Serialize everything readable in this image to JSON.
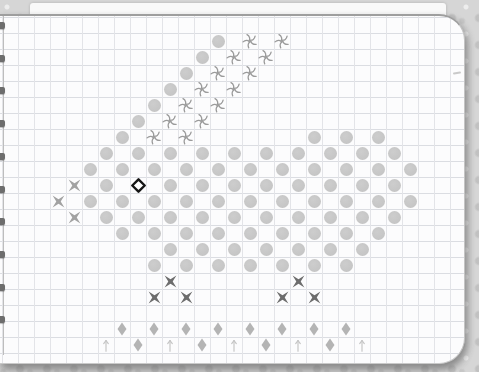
{
  "page": {
    "kind": "spiral-notebook-graph-paper",
    "paper_color": "#fcfcfd",
    "grid_line_color_v": "#e3e4e8",
    "grid_line_color_h": "#dbdde2",
    "background_color": "#d6d6d6",
    "binding": {
      "stub_count": 10,
      "stub_color": "#6d6d6d"
    }
  },
  "pattern": {
    "type": "stitch-chart-grid",
    "grid": {
      "cell": 16,
      "origin_x": 138,
      "origin_y": 169
    },
    "legend": {
      "O": "stitch-dot",
      "S": "stitch-swirl",
      "X": "stitch-cross-light",
      "XL": "stitch-cross-dark",
      "D": "stitch-diamond",
      "A": "stitch-arrow-up",
      "E": "stitch-eye"
    },
    "colors": {
      "dot": "#c6c6c6",
      "swirl": "#9b9b9b",
      "cross_light": "#a2a2a2",
      "cross_dark": "#6d6d6d",
      "diamond": "#b4b4b4",
      "arrow": "#c6c6c6",
      "eye_stroke": "#161616",
      "eye_fill": "#ffffff"
    },
    "rows": [
      {
        "r": -9,
        "items": [
          [
            "O",
            5
          ],
          [
            "S",
            7
          ],
          [
            "S",
            9
          ]
        ]
      },
      {
        "r": -8,
        "items": [
          [
            "O",
            4
          ],
          [
            "S",
            6
          ],
          [
            "S",
            8
          ]
        ]
      },
      {
        "r": -7,
        "items": [
          [
            "O",
            3
          ],
          [
            "S",
            5
          ],
          [
            "S",
            7
          ]
        ]
      },
      {
        "r": -6,
        "items": [
          [
            "O",
            2
          ],
          [
            "S",
            4
          ],
          [
            "S",
            6
          ]
        ]
      },
      {
        "r": -5,
        "items": [
          [
            "O",
            1
          ],
          [
            "S",
            3
          ],
          [
            "S",
            5
          ]
        ]
      },
      {
        "r": -4,
        "items": [
          [
            "O",
            0
          ],
          [
            "S",
            2
          ],
          [
            "S",
            4
          ]
        ]
      },
      {
        "r": -3,
        "items": [
          [
            "O",
            -1
          ],
          [
            "S",
            1
          ],
          [
            "S",
            3
          ],
          [
            "O",
            11
          ],
          [
            "O",
            13
          ],
          [
            "O",
            15
          ]
        ]
      },
      {
        "r": -2,
        "items": [
          [
            "O",
            -2
          ],
          [
            "O",
            0
          ],
          [
            "O",
            2
          ],
          [
            "O",
            4
          ],
          [
            "O",
            6
          ],
          [
            "O",
            8
          ],
          [
            "O",
            10
          ],
          [
            "O",
            12
          ],
          [
            "O",
            14
          ],
          [
            "O",
            16
          ]
        ]
      },
      {
        "r": -1,
        "items": [
          [
            "O",
            -3
          ],
          [
            "O",
            -1
          ],
          [
            "O",
            1
          ],
          [
            "O",
            3
          ],
          [
            "O",
            5
          ],
          [
            "O",
            7
          ],
          [
            "O",
            9
          ],
          [
            "O",
            11
          ],
          [
            "O",
            13
          ],
          [
            "O",
            15
          ],
          [
            "O",
            17
          ]
        ]
      },
      {
        "r": 0,
        "items": [
          [
            "X",
            -4
          ],
          [
            "O",
            -2
          ],
          [
            "E",
            0
          ],
          [
            "O",
            2
          ],
          [
            "O",
            4
          ],
          [
            "O",
            6
          ],
          [
            "O",
            8
          ],
          [
            "O",
            10
          ],
          [
            "O",
            12
          ],
          [
            "O",
            14
          ],
          [
            "O",
            16
          ]
        ]
      },
      {
        "r": 1,
        "items": [
          [
            "X",
            -5
          ],
          [
            "O",
            -3
          ],
          [
            "O",
            -1
          ],
          [
            "O",
            1
          ],
          [
            "O",
            3
          ],
          [
            "O",
            5
          ],
          [
            "O",
            7
          ],
          [
            "O",
            9
          ],
          [
            "O",
            11
          ],
          [
            "O",
            13
          ],
          [
            "O",
            15
          ],
          [
            "O",
            17
          ]
        ]
      },
      {
        "r": 2,
        "items": [
          [
            "X",
            -4
          ],
          [
            "O",
            -2
          ],
          [
            "O",
            0
          ],
          [
            "O",
            2
          ],
          [
            "O",
            4
          ],
          [
            "O",
            6
          ],
          [
            "O",
            8
          ],
          [
            "O",
            10
          ],
          [
            "O",
            12
          ],
          [
            "O",
            14
          ],
          [
            "O",
            16
          ]
        ]
      },
      {
        "r": 3,
        "items": [
          [
            "O",
            -1
          ],
          [
            "O",
            1
          ],
          [
            "O",
            3
          ],
          [
            "O",
            5
          ],
          [
            "O",
            7
          ],
          [
            "O",
            9
          ],
          [
            "O",
            11
          ],
          [
            "O",
            13
          ],
          [
            "O",
            15
          ]
        ]
      },
      {
        "r": 4,
        "items": [
          [
            "O",
            2
          ],
          [
            "O",
            4
          ],
          [
            "O",
            6
          ],
          [
            "O",
            8
          ],
          [
            "O",
            10
          ],
          [
            "O",
            12
          ],
          [
            "O",
            14
          ]
        ]
      },
      {
        "r": 5,
        "items": [
          [
            "O",
            1
          ],
          [
            "O",
            3
          ],
          [
            "O",
            5
          ],
          [
            "O",
            7
          ],
          [
            "O",
            9
          ],
          [
            "O",
            11
          ],
          [
            "O",
            13
          ]
        ]
      },
      {
        "r": 6,
        "items": [
          [
            "XL",
            2
          ],
          [
            "XL",
            10
          ]
        ]
      },
      {
        "r": 7,
        "items": [
          [
            "XL",
            1
          ],
          [
            "XL",
            3
          ],
          [
            "XL",
            9
          ],
          [
            "XL",
            11
          ]
        ]
      },
      {
        "r": 9,
        "items": [
          [
            "D",
            -1
          ],
          [
            "D",
            1
          ],
          [
            "D",
            3
          ],
          [
            "D",
            5
          ],
          [
            "D",
            7
          ],
          [
            "D",
            9
          ],
          [
            "D",
            11
          ],
          [
            "D",
            13
          ]
        ]
      },
      {
        "r": 10,
        "items": [
          [
            "A",
            -2
          ],
          [
            "D",
            0
          ],
          [
            "A",
            2
          ],
          [
            "D",
            4
          ],
          [
            "A",
            6
          ],
          [
            "D",
            8
          ],
          [
            "A",
            10
          ],
          [
            "D",
            12
          ],
          [
            "A",
            14
          ]
        ]
      }
    ]
  }
}
